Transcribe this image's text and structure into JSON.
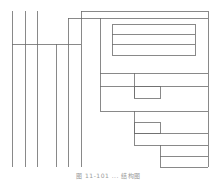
{
  "caption": "图 11-101 ... 结构图",
  "diagram": {
    "stroke_color": "#6b6b6b",
    "lines": [
      {
        "id": "left-v1",
        "x1": 12,
        "y1": 11,
        "x2": 12,
        "y2": 167
      },
      {
        "id": "left-v2",
        "x1": 25,
        "y1": 11,
        "x2": 25,
        "y2": 167
      },
      {
        "id": "left-v3",
        "x1": 37,
        "y1": 11,
        "x2": 37,
        "y2": 167
      },
      {
        "id": "left-v4",
        "x1": 56,
        "y1": 44,
        "x2": 56,
        "y2": 167
      },
      {
        "id": "left-v5",
        "x1": 68,
        "y1": 18,
        "x2": 68,
        "y2": 167
      },
      {
        "id": "left-v6",
        "x1": 81,
        "y1": 11,
        "x2": 81,
        "y2": 167
      },
      {
        "id": "left-h-bus",
        "x1": 12,
        "y1": 44,
        "x2": 81,
        "y2": 44
      },
      {
        "id": "top-h1",
        "x1": 81,
        "y1": 11,
        "x2": 208,
        "y2": 11
      },
      {
        "id": "top-h2",
        "x1": 68,
        "y1": 18,
        "x2": 208,
        "y2": 18
      },
      {
        "id": "right-edge",
        "x1": 208,
        "y1": 11,
        "x2": 208,
        "y2": 167
      },
      {
        "id": "mid-v",
        "x1": 100,
        "y1": 18,
        "x2": 100,
        "y2": 111
      },
      {
        "id": "mid-h1",
        "x1": 100,
        "y1": 73,
        "x2": 208,
        "y2": 73
      },
      {
        "id": "mid-h2",
        "x1": 100,
        "y1": 86,
        "x2": 208,
        "y2": 86
      },
      {
        "id": "mid-h3",
        "x1": 100,
        "y1": 111,
        "x2": 208,
        "y2": 111
      },
      {
        "id": "branch-v1",
        "x1": 134,
        "y1": 73,
        "x2": 134,
        "y2": 98
      },
      {
        "id": "branch-v2",
        "x1": 134,
        "y1": 111,
        "x2": 134,
        "y2": 145
      },
      {
        "id": "lower-h1",
        "x1": 134,
        "y1": 133,
        "x2": 208,
        "y2": 133
      },
      {
        "id": "lower-h2",
        "x1": 134,
        "y1": 145,
        "x2": 208,
        "y2": 145
      },
      {
        "id": "branch-v3",
        "x1": 160,
        "y1": 145,
        "x2": 160,
        "y2": 167
      },
      {
        "id": "bottom-h1",
        "x1": 160,
        "y1": 156,
        "x2": 208,
        "y2": 156
      },
      {
        "id": "bottom-h2",
        "x1": 160,
        "y1": 167,
        "x2": 208,
        "y2": 167
      }
    ],
    "rects": [
      {
        "id": "inner-box",
        "x": 112,
        "y": 24,
        "width": 83,
        "height": 31
      },
      {
        "id": "small-box-1",
        "x": 134,
        "y": 86,
        "width": 26,
        "height": 12
      },
      {
        "id": "small-box-2",
        "x": 134,
        "y": 122,
        "width": 26,
        "height": 11
      }
    ],
    "inner_box_dividers": [
      {
        "id": "inner-div-1",
        "x1": 112,
        "y1": 34,
        "x2": 195,
        "y2": 34
      },
      {
        "id": "inner-div-2",
        "x1": 112,
        "y1": 44,
        "x2": 195,
        "y2": 44
      }
    ]
  }
}
